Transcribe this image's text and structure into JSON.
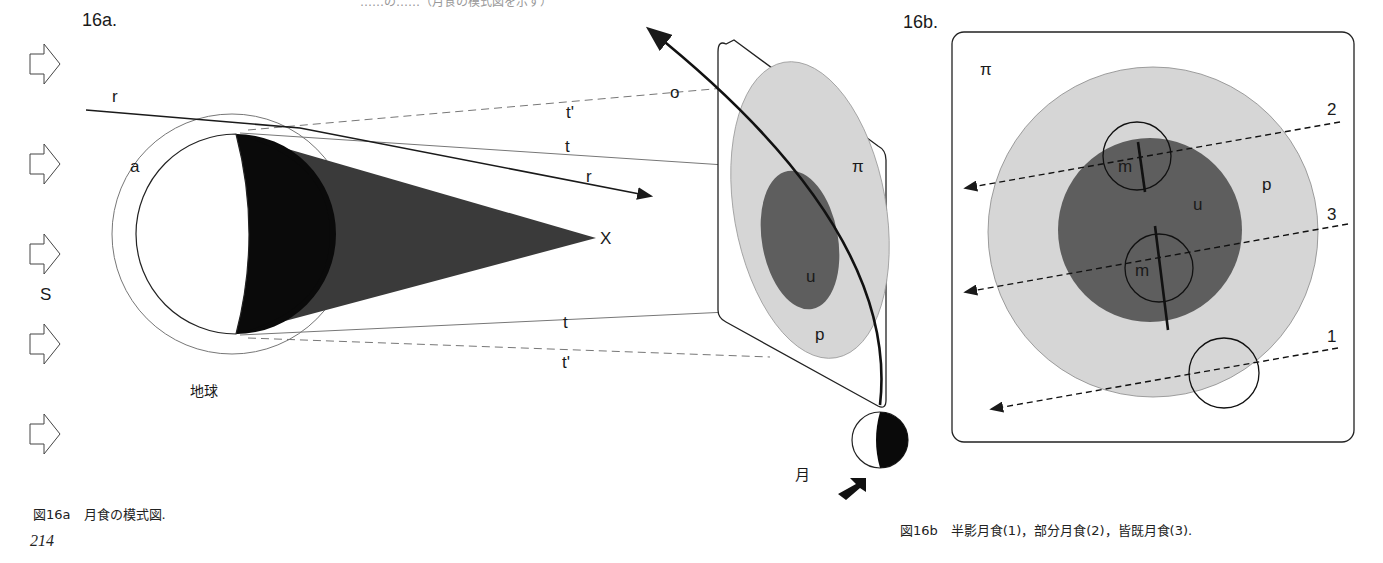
{
  "top_text_cut": "……の……（月食の模式図を示す）",
  "fig16a": {
    "label": "16a.",
    "sun_label": "S",
    "earth_label": "地球",
    "atmosphere_label": "a",
    "ray_label_r": "r",
    "tangent_label_t": "t",
    "tangent_label_t_prime": "t'",
    "apex_label": "X",
    "orbit_label": "o",
    "plane_label": "π",
    "umbra_label": "u",
    "penumbra_label": "p",
    "moon_label": "月",
    "caption": "図16a　月食の模式図."
  },
  "fig16b": {
    "label": "16b.",
    "plane_label": "π",
    "umbra_label": "u",
    "penumbra_label": "p",
    "moon_label": "m",
    "path_labels": [
      "1",
      "2",
      "3"
    ],
    "caption": "図16b　半影月食(1)，部分月食(2)，皆既月食(3)."
  },
  "page_number": "214",
  "colors": {
    "umbra": "#5e5e5e",
    "penumbra": "#d6d6d6",
    "shadow_cone": "#262626",
    "ink": "#1a1a1a"
  }
}
